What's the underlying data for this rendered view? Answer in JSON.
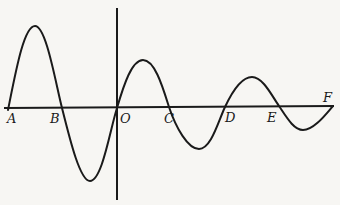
{
  "diagram": {
    "type": "damped-oscillation-curve",
    "axis_labels": {
      "A": "A",
      "B": "B",
      "O": "O",
      "C": "C",
      "D": "D",
      "E": "E",
      "F": "F"
    },
    "colors": {
      "background": "#f7f6f3",
      "ink": "#1a1a1a"
    }
  }
}
